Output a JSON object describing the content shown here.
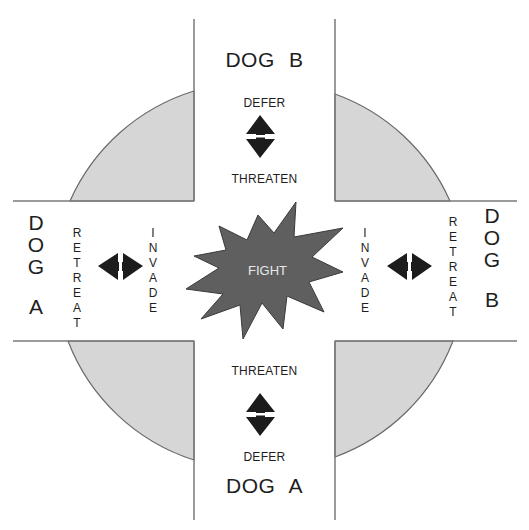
{
  "diagram": {
    "center": {
      "label": "FIGHT",
      "shape": "starburst",
      "fill": "#5f5f5f"
    },
    "top": {
      "dog_label": "DOG  B",
      "upper_action": "DEFER",
      "lower_action": "THREATEN",
      "arrow": "vertical-double-arrow"
    },
    "bottom": {
      "dog_label": "DOG  A",
      "upper_action": "THREATEN",
      "lower_action": "DEFER",
      "arrow": "vertical-double-arrow"
    },
    "left": {
      "dog_letters": [
        "D",
        "O",
        "G",
        "",
        "A"
      ],
      "outer_action_letters": [
        "R",
        "E",
        "T",
        "R",
        "E",
        "A",
        "T"
      ],
      "inner_action_letters": [
        "I",
        "N",
        "V",
        "A",
        "D",
        "E"
      ],
      "arrow": "horizontal-double-arrow"
    },
    "right": {
      "dog_letters": [
        "D",
        "O",
        "G",
        "",
        "B"
      ],
      "outer_action_letters": [
        "R",
        "E",
        "T",
        "R",
        "E",
        "A",
        "T"
      ],
      "inner_action_letters": [
        "I",
        "N",
        "V",
        "A",
        "D",
        "E"
      ],
      "arrow": "horizontal-double-arrow"
    },
    "colors": {
      "quadrant_fill": "#d6d6d6",
      "line": "#7a7a7a",
      "arrow": "#1c1c1c",
      "starburst": "#5f5f5f"
    }
  }
}
